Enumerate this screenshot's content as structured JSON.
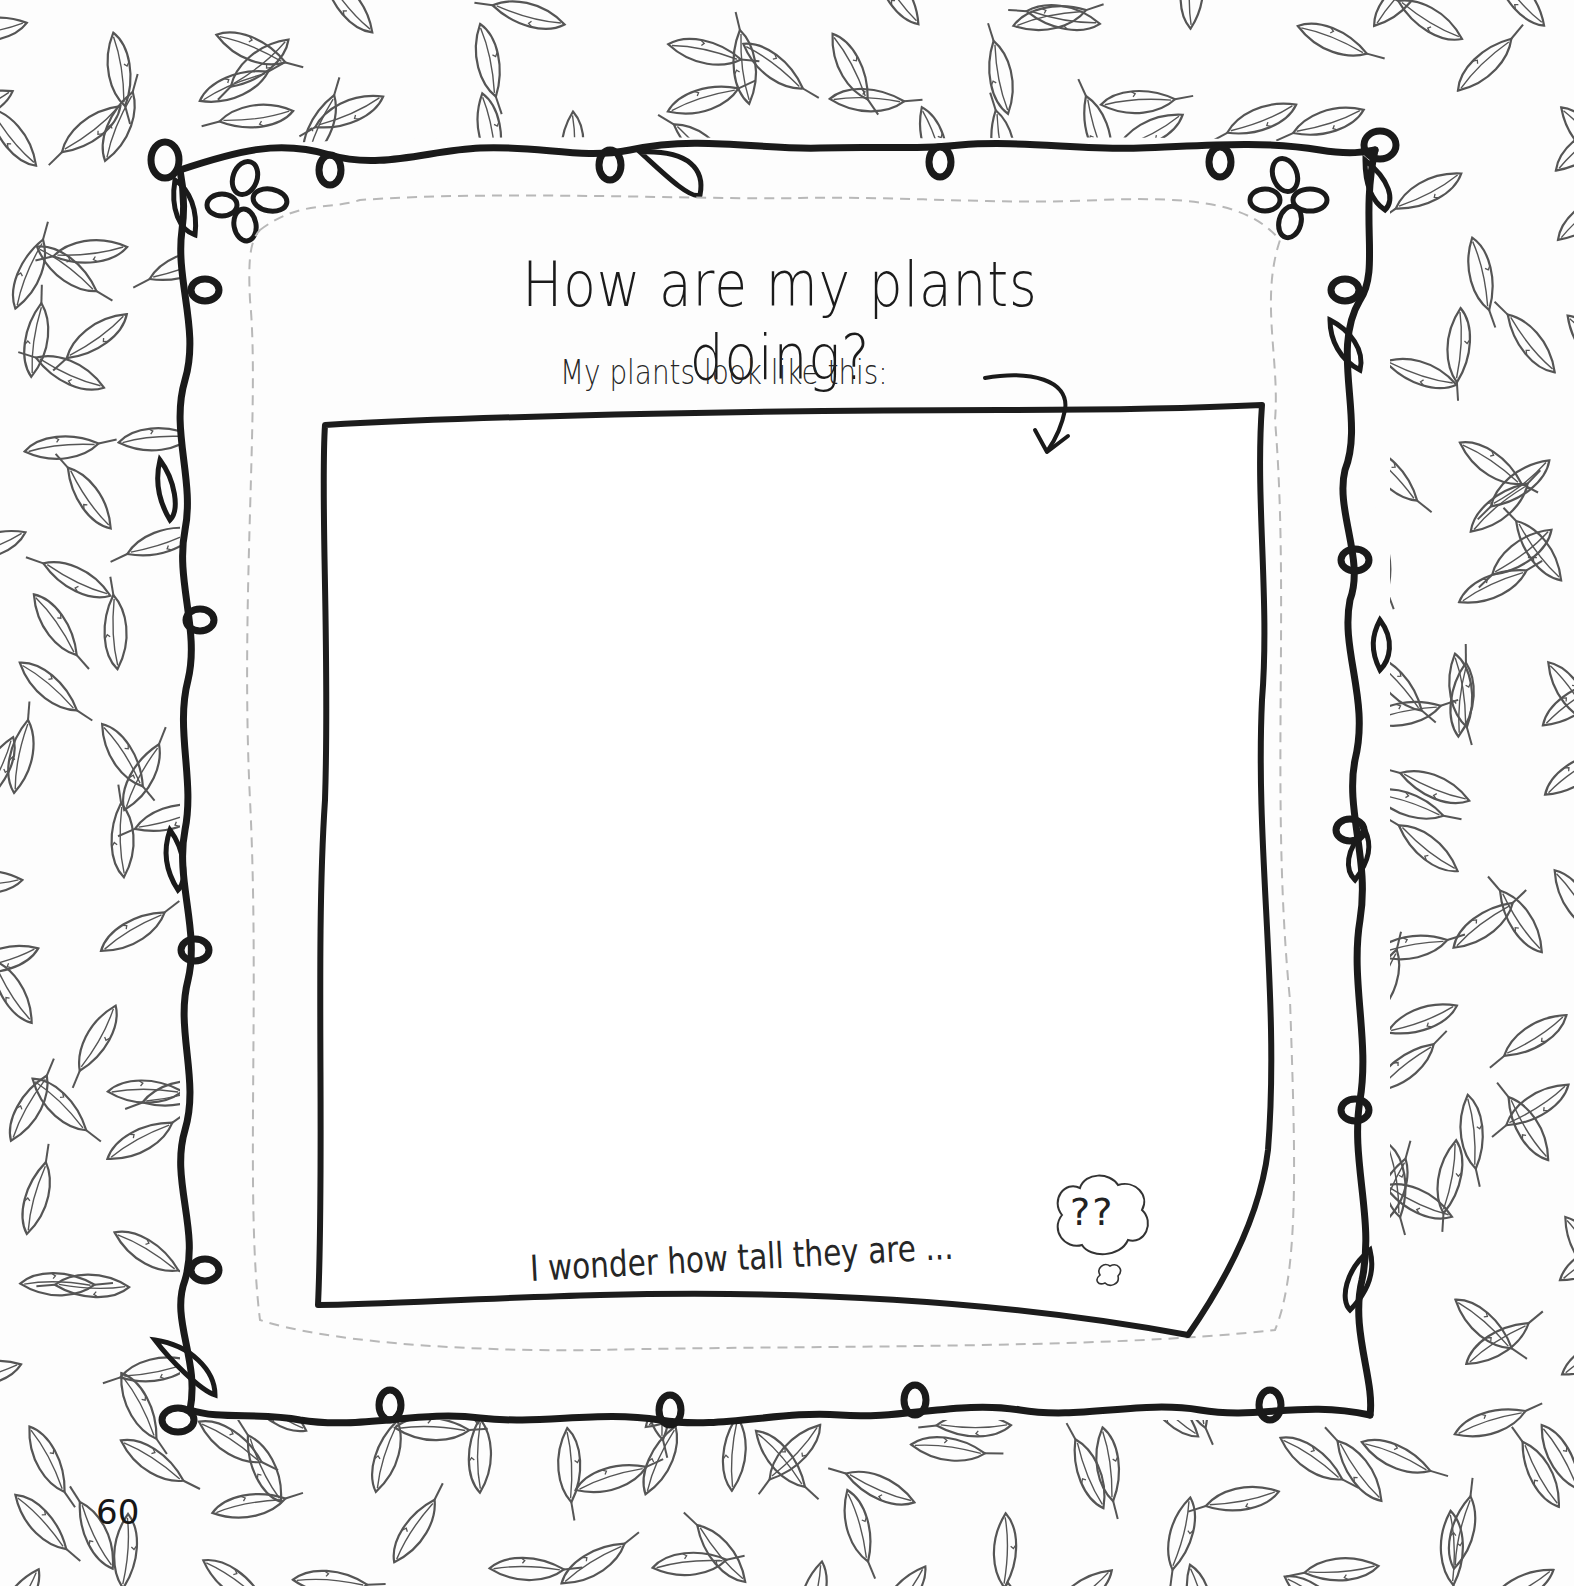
{
  "page": {
    "title": "How are my plants doing?",
    "subtitle": "My plants look like this:",
    "prompt": "I wonder how tall they are ...",
    "thought_bubble_text": "??",
    "page_number": "60"
  },
  "decorations": {
    "background_pattern": "leaf-pattern",
    "frame": "curly-vine-frame",
    "corner_flowers": [
      "top-left-flower",
      "top-right-flower"
    ],
    "arrow": "curved-arrow-down",
    "thought_bubble": "thought-cloud"
  },
  "colors": {
    "ink": "#1a1a1a",
    "leaf_line": "#555555",
    "dashed_line": "#b8b8b8",
    "paper": "#fdfdfd"
  }
}
